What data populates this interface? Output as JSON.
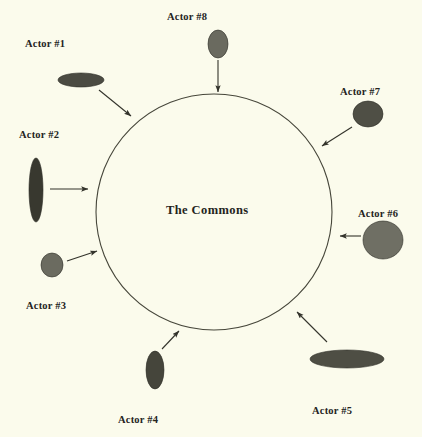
{
  "diagram": {
    "title": "The Commons",
    "background_color": "#fbfbec",
    "stroke_color": "#3a3a30",
    "commons": {
      "label": "The Commons",
      "label_x": 166,
      "label_y": 203,
      "center_x": 214,
      "center_y": 212,
      "radius": 118,
      "fill": "none",
      "stroke": "#46463a",
      "stroke_width": 1.1
    },
    "actors": [
      {
        "id": "actor-1",
        "label": "Actor #1",
        "label_x": 25,
        "label_y": 38,
        "shape": "ellipse",
        "cx": 81,
        "cy": 80,
        "rx": 23,
        "ry": 7,
        "fill": "#4b4b42",
        "arrow": {
          "x1": 99,
          "y1": 90,
          "x2": 131,
          "y2": 116
        }
      },
      {
        "id": "actor-2",
        "label": "Actor #2",
        "label_x": 19,
        "label_y": 129,
        "shape": "ellipse",
        "cx": 36,
        "cy": 190,
        "rx": 7,
        "ry": 32,
        "fill": "#38382f",
        "arrow": {
          "x1": 50,
          "y1": 189,
          "x2": 88,
          "y2": 189
        }
      },
      {
        "id": "actor-3",
        "label": "Actor #3",
        "label_x": 26,
        "label_y": 300,
        "shape": "ellipse",
        "cx": 52,
        "cy": 265,
        "rx": 11,
        "ry": 12,
        "fill": "#6b6b60",
        "arrow": {
          "x1": 67,
          "y1": 261,
          "x2": 97,
          "y2": 251
        }
      },
      {
        "id": "actor-4",
        "label": "Actor #4",
        "label_x": 118,
        "label_y": 414,
        "shape": "ellipse",
        "cx": 155,
        "cy": 370,
        "rx": 9,
        "ry": 19,
        "fill": "#45453b",
        "arrow": {
          "x1": 162,
          "y1": 349,
          "x2": 179,
          "y2": 331
        }
      },
      {
        "id": "actor-5",
        "label": "Actor #5",
        "label_x": 312,
        "label_y": 405,
        "shape": "ellipse",
        "cx": 347,
        "cy": 359,
        "rx": 37,
        "ry": 9,
        "fill": "#4e4e44",
        "arrow": {
          "x1": 327,
          "y1": 342,
          "x2": 297,
          "y2": 312
        }
      },
      {
        "id": "actor-6",
        "label": "Actor #6",
        "label_x": 358,
        "label_y": 208,
        "shape": "ellipse",
        "cx": 383,
        "cy": 240,
        "rx": 20,
        "ry": 19,
        "fill": "#6f6f64",
        "arrow": {
          "x1": 361,
          "y1": 236,
          "x2": 340,
          "y2": 236
        }
      },
      {
        "id": "actor-7",
        "label": "Actor #7",
        "label_x": 340,
        "label_y": 86,
        "shape": "ellipse",
        "cx": 368,
        "cy": 114,
        "rx": 15,
        "ry": 13,
        "fill": "#4f4f45",
        "arrow": {
          "x1": 352,
          "y1": 127,
          "x2": 322,
          "y2": 146
        }
      },
      {
        "id": "actor-8",
        "label": "Actor #8",
        "label_x": 167,
        "label_y": 11,
        "shape": "ellipse",
        "cx": 218,
        "cy": 44,
        "rx": 10,
        "ry": 14,
        "fill": "#6a6a5f",
        "arrow": {
          "x1": 218,
          "y1": 60,
          "x2": 218,
          "y2": 92
        }
      }
    ]
  }
}
